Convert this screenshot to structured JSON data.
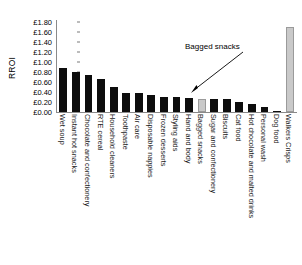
{
  "chart_data": {
    "type": "bar",
    "title": "",
    "xlabel": "",
    "ylabel": "RROI",
    "ylim": [
      0,
      1.8
    ],
    "ytick_labels": [
      "£1.80",
      "£1.60",
      "£1.40",
      "£1.20",
      "£1.00",
      "£0.80",
      "£0.60",
      "£0.40",
      "£0.20",
      "£0.00"
    ],
    "ytick_values": [
      1.8,
      1.6,
      1.4,
      1.2,
      1.0,
      0.8,
      0.6,
      0.4,
      0.2,
      0.0
    ],
    "grid": false,
    "legend": "none",
    "currency": "GBP",
    "categories": [
      "Wet soup",
      "Instant hot snacks",
      "Chocolate and confectionery",
      "RTE cereal",
      "Household cleaners",
      "Toothpaste",
      "Air care",
      "Disposable nappies",
      "Frozen desserts",
      "Styling aids",
      "Hand and body",
      "Bagged snacks",
      "Sugar and confectionery",
      "Biscuits",
      "Cat food",
      "Hot chocolate and malted drinks",
      "Personal wash",
      "Dog food",
      "Walkers Crisps"
    ],
    "values": [
      0.88,
      0.8,
      0.74,
      0.67,
      0.5,
      0.38,
      0.38,
      0.34,
      0.3,
      0.3,
      0.29,
      0.27,
      0.27,
      0.26,
      0.21,
      0.17,
      0.1,
      0.03,
      1.7
    ],
    "series": [
      {
        "name": "RROI",
        "values": [
          0.88,
          0.8,
          0.74,
          0.67,
          0.5,
          0.38,
          0.38,
          0.34,
          0.3,
          0.3,
          0.29,
          0.27,
          0.27,
          0.26,
          0.21,
          0.17,
          0.1,
          0.03,
          1.7
        ]
      }
    ],
    "bar_colors": [
      "#0d0d0d",
      "#0d0d0d",
      "#0d0d0d",
      "#0d0d0d",
      "#0d0d0d",
      "#0d0d0d",
      "#0d0d0d",
      "#0d0d0d",
      "#0d0d0d",
      "#0d0d0d",
      "#0d0d0d",
      "#c9c9c9",
      "#0d0d0d",
      "#0d0d0d",
      "#0d0d0d",
      "#0d0d0d",
      "#0d0d0d",
      "#0d0d0d",
      "#c9c9c9"
    ],
    "highlight_color": "#c9c9c9",
    "default_color": "#0d0d0d",
    "annotations": [
      {
        "text": "Bagged snacks",
        "points_to": "Bagged snacks"
      }
    ]
  }
}
